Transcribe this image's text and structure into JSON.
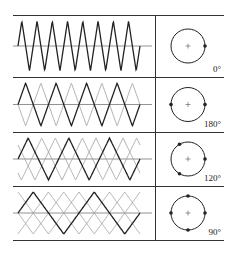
{
  "figure": {
    "rows": [
      {
        "phase_label": "0°",
        "num_phases": 1,
        "phase_angles_deg": [
          0
        ],
        "solid_peaks": 8
      },
      {
        "phase_label": "180°",
        "num_phases": 2,
        "phase_angles_deg": [
          0,
          180
        ],
        "solid_peaks": 4
      },
      {
        "phase_label": "120°",
        "num_phases": 3,
        "phase_angles_deg": [
          0,
          120,
          240
        ],
        "solid_peaks": 3
      },
      {
        "phase_label": "90°",
        "num_phases": 4,
        "phase_angles_deg": [
          0,
          90,
          180,
          270
        ],
        "solid_peaks": 2
      }
    ],
    "caption": ""
  },
  "colors": {
    "line": "#222222",
    "secondary": "#9a9a9a",
    "axis": "#777777"
  }
}
